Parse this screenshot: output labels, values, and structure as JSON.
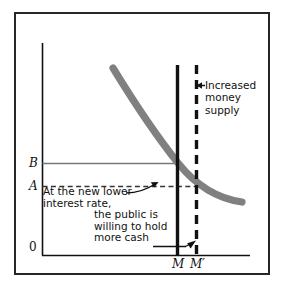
{
  "diagram": {
    "type": "economics-money-market",
    "title_text": "",
    "axes": {
      "origin_label": "0",
      "y_axis_name": "interest-rate-axis",
      "x_axis_name": "money-quantity-axis",
      "y_tick_labels": [
        "B",
        "A"
      ],
      "x_tick_labels": [
        "M",
        "M′"
      ]
    },
    "curve": {
      "name": "money-demand-curve",
      "color": "#808080",
      "description": "downward sloping demand for money"
    },
    "supply_lines": [
      {
        "label": "M",
        "style": "solid",
        "color": "#111111"
      },
      {
        "label": "M′",
        "style": "dashed",
        "color": "#111111"
      }
    ],
    "annotations": {
      "increased_supply": {
        "line1": "Increased",
        "line2": "money",
        "line3": "supply"
      },
      "lower_rate": {
        "line1": "At the new lower",
        "line2": "interest rate,",
        "line3": "the public is",
        "line4": "willing to hold",
        "line5": "more cash"
      }
    },
    "colors": {
      "frame": "#262626",
      "axis": "#111111",
      "curve": "#808080",
      "level_line": "#777777",
      "background": "#ffffff"
    }
  }
}
